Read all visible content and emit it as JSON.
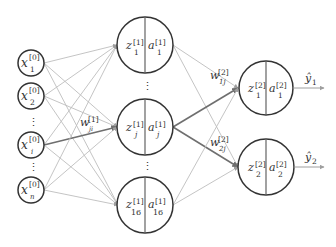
{
  "diagram": {
    "type": "feed-forward neural network",
    "colors": {
      "node_stroke": "#333333",
      "edge": "#bdbdbd",
      "edge_highlight": "#6f6f6f",
      "background": "#ffffff"
    },
    "input_layer": {
      "nodes": [
        {
          "var": "x",
          "sup": "[0]",
          "sub": "1"
        },
        {
          "var": "x",
          "sup": "[0]",
          "sub": "2"
        },
        {
          "var": "x",
          "sup": "[0]",
          "sub": "i"
        },
        {
          "var": "x",
          "sup": "[0]",
          "sub": "n"
        }
      ],
      "ellipsis": "⋮"
    },
    "hidden_layer": {
      "nodes": [
        {
          "z_var": "z",
          "z_sup": "[1]",
          "z_sub": "1",
          "a_var": "a",
          "a_sup": "[1]",
          "a_sub": "1"
        },
        {
          "z_var": "z",
          "z_sup": "[1]",
          "z_sub": "j",
          "a_var": "a",
          "a_sup": "[1]",
          "a_sub": "j"
        },
        {
          "z_var": "z",
          "z_sup": "[1]",
          "z_sub": "16",
          "a_var": "a",
          "a_sup": "[1]",
          "a_sub": "16"
        }
      ],
      "ellipsis": "⋮"
    },
    "output_layer": {
      "nodes": [
        {
          "z_var": "z",
          "z_sup": "[2]",
          "z_sub": "1",
          "a_var": "a",
          "a_sup": "[2]",
          "a_sub": "1",
          "output": "ŷ",
          "output_sub": "1"
        },
        {
          "z_var": "z",
          "z_sup": "[2]",
          "z_sub": "2",
          "a_var": "a",
          "a_sup": "[2]",
          "a_sub": "2",
          "output": "ŷ",
          "output_sub": "2"
        }
      ]
    },
    "weight_labels": [
      {
        "var": "w",
        "sup": "[1]",
        "sub": "ji"
      },
      {
        "var": "w",
        "sup": "[2]",
        "sub": "1j"
      },
      {
        "var": "w",
        "sup": "[2]",
        "sub": "2j"
      }
    ]
  }
}
